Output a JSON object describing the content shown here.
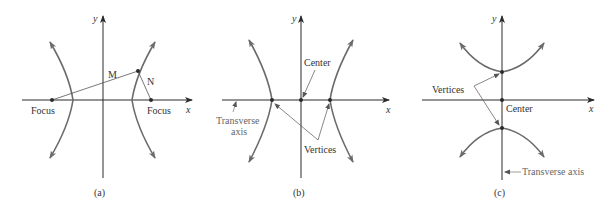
{
  "colors": {
    "axis": "#2a2a2a",
    "curve": "#6b6b6b",
    "text": "#333333",
    "callout": "#666666"
  },
  "panels": [
    {
      "id": "a",
      "caption": "(a)",
      "axis_x_label": "x",
      "axis_y_label": "y",
      "labels": {
        "focus_left": "Focus",
        "focus_right": "Focus",
        "segment_m": "M",
        "segment_n": "N"
      }
    },
    {
      "id": "b",
      "caption": "(b)",
      "axis_x_label": "x",
      "axis_y_label": "y",
      "labels": {
        "center": "Center",
        "transverse_axis_line1": "Transverse",
        "transverse_axis_line2": "axis",
        "vertices": "Vertices"
      }
    },
    {
      "id": "c",
      "caption": "(c)",
      "axis_x_label": "x",
      "axis_y_label": "y",
      "labels": {
        "vertices": "Vertices",
        "center": "Center",
        "transverse_axis": "Transverse axis"
      }
    }
  ]
}
